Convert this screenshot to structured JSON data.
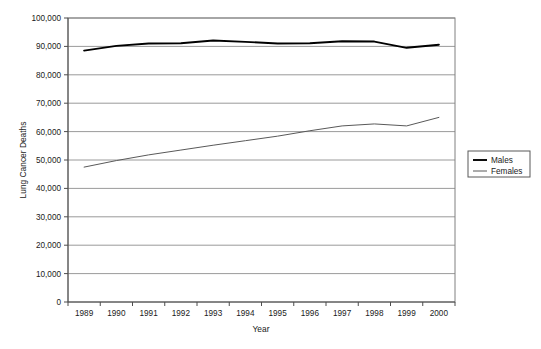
{
  "chart_data": {
    "type": "line",
    "title": "",
    "xlabel": "Year",
    "ylabel": "Lung Cancer Deaths",
    "x": [
      1989,
      1990,
      1991,
      1992,
      1993,
      1994,
      1995,
      1996,
      1997,
      1998,
      1999,
      2000
    ],
    "categories": [
      "1989",
      "1990",
      "1991",
      "1992",
      "1993",
      "1994",
      "1995",
      "1996",
      "1997",
      "1998",
      "1999",
      "2000"
    ],
    "series": [
      {
        "name": "Males",
        "color": "#000000",
        "values": [
          88500,
          90200,
          91000,
          91100,
          92100,
          91600,
          91000,
          91100,
          91800,
          91700,
          89500,
          90600
        ]
      },
      {
        "name": "Females",
        "color": "#595959",
        "values": [
          47500,
          49800,
          51800,
          53500,
          55200,
          56800,
          58400,
          60300,
          62000,
          62700,
          62000,
          65000
        ]
      }
    ],
    "ylim": [
      0,
      100000
    ],
    "yticks": [
      0,
      10000,
      20000,
      30000,
      40000,
      50000,
      60000,
      70000,
      80000,
      90000,
      100000
    ],
    "ytick_labels": [
      "0",
      "10,000",
      "20,000",
      "30,000",
      "40,000",
      "50,000",
      "60,000",
      "70,000",
      "80,000",
      "90,000",
      "100,000"
    ],
    "grid": "horizontal",
    "legend_position": "right",
    "legend_entries": [
      "Males",
      "Females"
    ]
  }
}
